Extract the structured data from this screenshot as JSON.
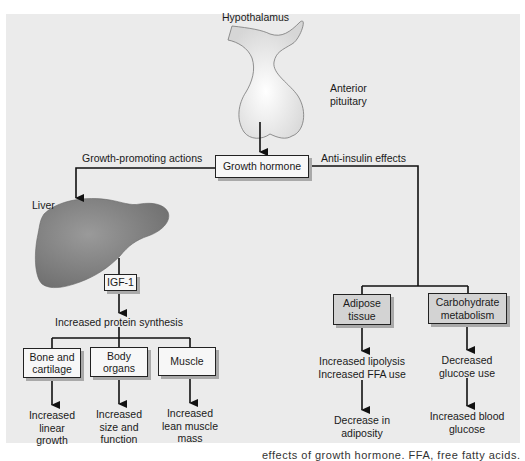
{
  "diagram": {
    "title_nodes": {
      "hypothalamus": "Hypothalamus",
      "anterior_pituitary_1": "Anterior",
      "anterior_pituitary_2": "pituitary",
      "growth_hormone": "Growth hormone",
      "liver": "Liver",
      "igf1": "IGF-1"
    },
    "edges": {
      "left_branch": "Growth-promoting actions",
      "right_branch": "Anti-insulin effects",
      "protein": "Increased protein synthesis"
    },
    "targets": [
      {
        "box_1": "Bone and",
        "box_2": "cartilage",
        "effect_1": "Increased",
        "effect_2": "linear",
        "effect_3": "growth"
      },
      {
        "box_1": "Body",
        "box_2": "organs",
        "effect_1": "Increased",
        "effect_2": "size and",
        "effect_3": "function"
      },
      {
        "box_1": "Muscle",
        "box_2": "",
        "effect_1": "Increased",
        "effect_2": "lean muscle",
        "effect_3": "mass"
      }
    ],
    "anti_insulin": [
      {
        "box_1": "Adipose",
        "box_2": "tissue",
        "effect_1": "Increased lipolysis",
        "effect_2": "Increased FFA use",
        "final_1": "Decrease in",
        "final_2": "adiposity"
      },
      {
        "box_1": "Carbohydrate",
        "box_2": "metabolism",
        "effect_1": "Decreased",
        "effect_2": "glucose use",
        "final_1": "Increased blood",
        "final_2": "glucose"
      }
    ],
    "caption_partial": "effects of growth hormone. FFA, free fatty acids."
  },
  "colors": {
    "panel_bg": "#ebebeb",
    "box_bg": "#f7f7f7",
    "box_shaded": "#d3d3d3",
    "liver": "#8a8a8a",
    "line": "#111111"
  }
}
